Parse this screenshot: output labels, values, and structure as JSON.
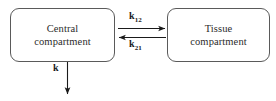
{
  "diagram": {
    "background_color": "#ffffff",
    "stroke_color": "#5a5a5a",
    "text_color": "#2b2b2b",
    "boxes": [
      {
        "id": "central",
        "line1": "Central",
        "line2": "compartment"
      },
      {
        "id": "tissue",
        "line1": "Tissue",
        "line2": "compartment"
      }
    ],
    "arrows": {
      "forward": {
        "label_base": "k",
        "label_sub": "12",
        "direction": "right"
      },
      "backward": {
        "label_base": "k",
        "label_sub": "21",
        "direction": "left"
      },
      "elimination": {
        "label_base": "k",
        "label_sub": "",
        "direction": "down"
      }
    }
  }
}
